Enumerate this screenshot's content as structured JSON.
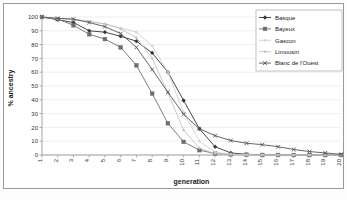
{
  "chart_data": {
    "type": "line",
    "title": "",
    "xlabel": "generation",
    "ylabel": "% ancestry",
    "xlim": [
      1,
      20
    ],
    "ylim": [
      0,
      100
    ],
    "grid": true,
    "legend_position": "top-right",
    "categories": [
      1,
      2,
      3,
      4,
      5,
      6,
      7,
      8,
      9,
      10,
      11,
      12,
      13,
      14,
      15,
      16,
      17,
      18,
      19,
      20
    ],
    "xticks": [
      "1",
      "2",
      "3",
      "4",
      "5",
      "6",
      "7",
      "8",
      "9",
      "10",
      "11",
      "12",
      "13",
      "14",
      "15",
      "16",
      "17",
      "18",
      "19",
      "20"
    ],
    "yticks": [
      "0",
      "10",
      "20",
      "30",
      "40",
      "50",
      "60",
      "70",
      "80",
      "90",
      "100"
    ],
    "series": [
      {
        "name": "Basque",
        "marker": "diamond",
        "color": "#333333",
        "values": [
          100,
          98,
          96,
          90,
          89,
          86,
          82.5,
          74,
          60,
          39.5,
          19,
          6,
          1.5,
          0.5,
          0.2,
          0,
          0,
          0,
          0,
          0
        ]
      },
      {
        "name": "Bayeux",
        "marker": "square",
        "color": "#6e6e6e",
        "values": [
          100,
          98.5,
          94,
          87.5,
          84,
          78,
          65,
          44.5,
          23,
          9.5,
          3.5,
          1,
          0.4,
          0.2,
          0,
          0,
          0,
          0,
          0,
          0
        ]
      },
      {
        "name": "Gascon",
        "marker": "none",
        "color": "#d0d0d0",
        "values": [
          100,
          99,
          98.5,
          97,
          95,
          92,
          89,
          79,
          60,
          31,
          10,
          2,
          0.6,
          0.2,
          0,
          0,
          0,
          0,
          0,
          0
        ]
      },
      {
        "name": "Limousin",
        "marker": "none",
        "color": "#c2c2c2",
        "values": [
          100,
          99,
          98,
          96.5,
          95,
          91.5,
          85,
          70,
          45,
          18,
          5,
          1,
          0.3,
          0,
          0,
          0,
          0,
          0,
          0,
          0
        ]
      },
      {
        "name": "Blanc de l'Ouest",
        "marker": "cross",
        "color": "#555555",
        "values": [
          100,
          99,
          98.5,
          96,
          93,
          88,
          78,
          62,
          45.5,
          29.5,
          19,
          14,
          10.5,
          8.5,
          7.5,
          6,
          4,
          2.5,
          1.5,
          0.5
        ]
      }
    ]
  },
  "legend": {
    "entries": [
      {
        "label": "Basque"
      },
      {
        "label": "Bayeux"
      },
      {
        "label": "Gascon"
      },
      {
        "label": "Limousin"
      },
      {
        "label": "Blanc de l'Ouest"
      }
    ]
  }
}
